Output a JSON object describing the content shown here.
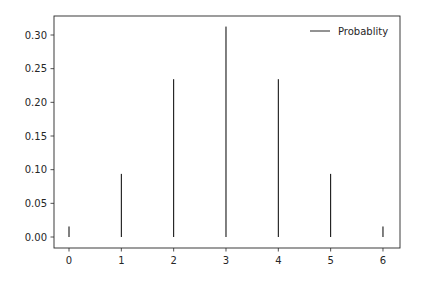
{
  "chart_data": {
    "type": "bar",
    "style": "stem/vlines",
    "title": "",
    "xlabel": "",
    "ylabel": "",
    "categories": [
      0,
      1,
      2,
      3,
      4,
      5,
      6
    ],
    "series": [
      {
        "name": "Probablity",
        "values": [
          0.015625,
          0.09375,
          0.234375,
          0.3125,
          0.234375,
          0.09375,
          0.015625
        ],
        "color": "#000000"
      }
    ],
    "xlim": [
      -0.32,
      6.32
    ],
    "ylim": [
      -0.0156,
      0.328
    ],
    "xticks": [
      "0",
      "1",
      "2",
      "3",
      "4",
      "5",
      "6"
    ],
    "yticks": [
      "0.00",
      "0.05",
      "0.10",
      "0.15",
      "0.20",
      "0.25",
      "0.30"
    ],
    "grid": false,
    "legend_position": "upper right"
  },
  "legend": {
    "label": "Probablity"
  }
}
